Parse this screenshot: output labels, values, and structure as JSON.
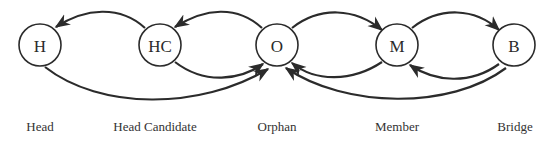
{
  "diagram": {
    "type": "state-transition",
    "nodes": [
      {
        "id": "H",
        "label": "H",
        "caption": "Head",
        "cx": 40,
        "cy": 45
      },
      {
        "id": "HC",
        "label": "HC",
        "caption": "Head Candidate",
        "cx": 160,
        "cy": 45
      },
      {
        "id": "O",
        "label": "O",
        "caption": "Orphan",
        "cx": 277,
        "cy": 45
      },
      {
        "id": "M",
        "label": "M",
        "caption": "Member",
        "cx": 397,
        "cy": 45
      },
      {
        "id": "B",
        "label": "B",
        "caption": "Bridge",
        "cx": 514,
        "cy": 45
      }
    ],
    "edges": [
      {
        "from": "HC",
        "to": "H"
      },
      {
        "from": "O",
        "to": "HC"
      },
      {
        "from": "H",
        "to": "O"
      },
      {
        "from": "HC",
        "to": "O"
      },
      {
        "from": "O",
        "to": "M"
      },
      {
        "from": "M",
        "to": "B"
      },
      {
        "from": "M",
        "to": "O"
      },
      {
        "from": "B",
        "to": "M"
      },
      {
        "from": "B",
        "to": "O"
      }
    ],
    "colors": {
      "stroke": "#2b2b2b",
      "background": "#ffffff"
    }
  }
}
